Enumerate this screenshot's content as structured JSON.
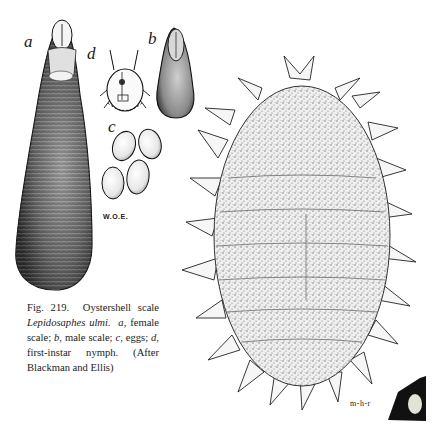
{
  "figure": {
    "number_label": "Fig. 219.",
    "title": "Oystershell scale",
    "species": "Lepidosaphes ulmi.",
    "caption_parts": [
      {
        "key": "a",
        "text": ", female scale; "
      },
      {
        "key": "b",
        "text": ", male scale; "
      },
      {
        "key": "c",
        "text": ", eggs; "
      },
      {
        "key": "d",
        "text": ", first-instar nymph.  (After Blackman and Ellis)"
      }
    ],
    "panel_labels": {
      "a": "a",
      "b": "b",
      "c": "c",
      "d": "d"
    },
    "signatures": {
      "left": "W.O.E.",
      "right": "m-h-r"
    },
    "colors": {
      "ink": "#1a1a1a",
      "paper": "#ffffff",
      "stipple": "#8a8a8a"
    }
  }
}
